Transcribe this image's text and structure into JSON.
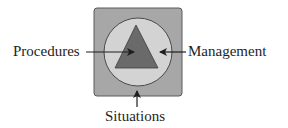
{
  "diagram": {
    "labels": {
      "left": "Procedures",
      "right": "Management",
      "bottom": "Situations"
    },
    "shapes": {
      "outer_square": {
        "label_ref": "bottom",
        "fill": "#a7a7a7",
        "stroke": "#5a5a5a"
      },
      "circle": {
        "label_ref": "right",
        "fill": "#d3d3d3",
        "stroke": "#4a4a4a"
      },
      "triangle": {
        "label_ref": "left",
        "fill": "#6a6a6a",
        "stroke": "#3c3c3c"
      }
    },
    "colors": {
      "text": "#1e1e1e",
      "arrow": "#1e1e1e"
    }
  }
}
